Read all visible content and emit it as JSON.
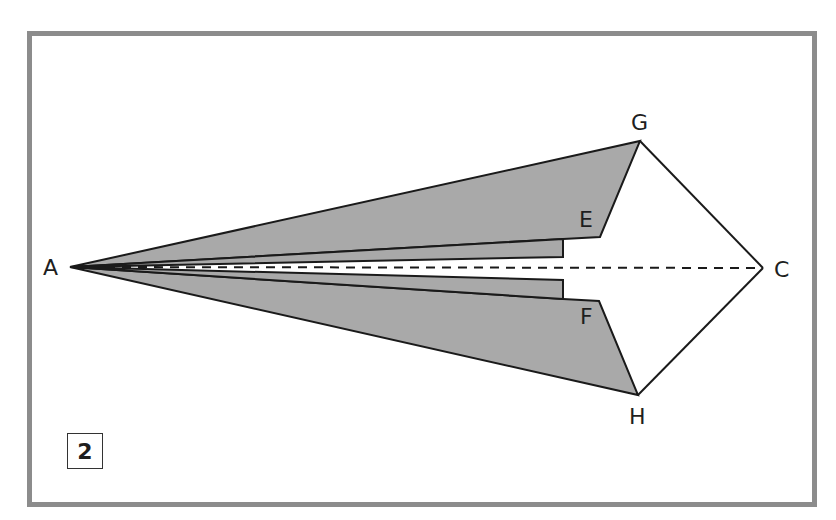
{
  "diagram": {
    "type": "origami-fold-step",
    "step_number": "2",
    "labels": {
      "A": "A",
      "C": "C",
      "E": "E",
      "F": "F",
      "G": "G",
      "H": "H"
    },
    "points": {
      "A": [
        70,
        267
      ],
      "C": [
        763,
        268
      ],
      "G": [
        640,
        141
      ],
      "H": [
        638,
        395
      ],
      "E": [
        600,
        237
      ],
      "F": [
        599,
        301
      ]
    },
    "colors": {
      "frame": "#8c8c8c",
      "flap_fill": "#a9a9a9",
      "stroke": "#1a1a1a",
      "background": "#ffffff"
    },
    "fold_line": "dashed A to C"
  }
}
